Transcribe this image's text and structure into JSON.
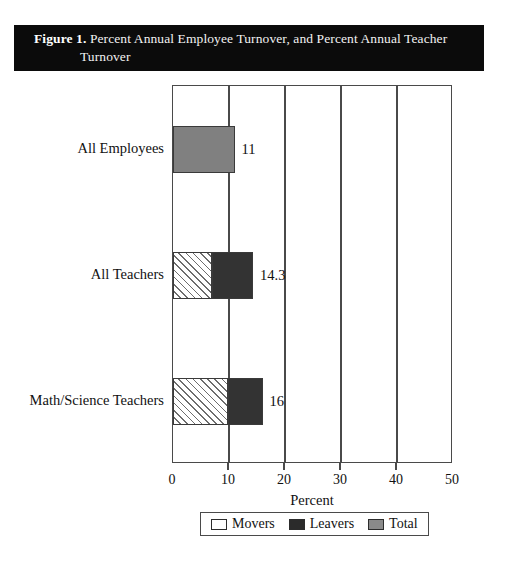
{
  "figure": {
    "label": "Figure 1.",
    "caption_line1": "Percent Annual Employee Turnover, and Percent Annual Teacher",
    "caption_line2": "Turnover"
  },
  "chart_data": {
    "type": "bar",
    "orientation": "horizontal",
    "stacked": true,
    "title": "Percent Annual Employee Turnover, and Percent Annual Teacher Turnover",
    "xlabel": "Percent",
    "ylabel": "",
    "xlim": [
      0,
      50
    ],
    "xticks": [
      0,
      10,
      20,
      30,
      40,
      50
    ],
    "xtick_labels": [
      "0",
      "10",
      "20",
      "30",
      "40",
      "50"
    ],
    "grid": true,
    "legend_position": "bottom",
    "categories": [
      "All Employees",
      "All Teachers",
      "Math/Science Teachers"
    ],
    "series": [
      {
        "name": "Movers",
        "color": "#ffffff",
        "pattern": "diagonal-hatch",
        "values": [
          0,
          7.0,
          9.8
        ]
      },
      {
        "name": "Leavers",
        "color": "#333333",
        "pattern": "solid",
        "values": [
          0,
          7.3,
          6.2
        ]
      },
      {
        "name": "Total",
        "color": "#808080",
        "pattern": "solid",
        "values": [
          11,
          0,
          0
        ]
      }
    ],
    "bars": [
      {
        "category": "All Employees",
        "value_label": "11",
        "total": 11,
        "segments": [
          {
            "series": "Total",
            "start": 0,
            "end": 11
          }
        ]
      },
      {
        "category": "All Teachers",
        "value_label": "14.3",
        "total": 14.3,
        "segments": [
          {
            "series": "Movers",
            "start": 0,
            "end": 7.0
          },
          {
            "series": "Leavers",
            "start": 7.0,
            "end": 14.3
          }
        ]
      },
      {
        "category": "Math/Science Teachers",
        "value_label": "16",
        "total": 16,
        "segments": [
          {
            "series": "Movers",
            "start": 0,
            "end": 9.8
          },
          {
            "series": "Leavers",
            "start": 9.8,
            "end": 16
          }
        ]
      }
    ],
    "legend": [
      {
        "label": "Movers",
        "swatch": "white-outline"
      },
      {
        "label": "Leavers",
        "swatch": "dark-fill"
      },
      {
        "label": "Total",
        "swatch": "gray-fill"
      }
    ]
  }
}
